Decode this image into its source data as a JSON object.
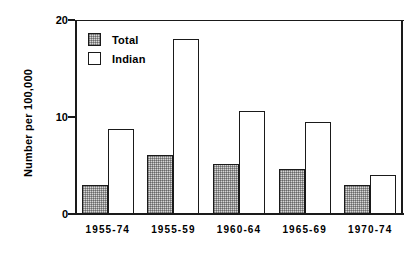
{
  "chart_data": {
    "type": "bar",
    "title": "",
    "xlabel": "",
    "ylabel": "Number per 100,000",
    "ylim": [
      0,
      20
    ],
    "yticks": [
      0,
      10,
      20
    ],
    "ytick_labels": [
      "0",
      "10",
      "20"
    ],
    "grid": false,
    "legend_position": "upper-left-inside",
    "categories": [
      "1955-74",
      "1955-59",
      "1960-64",
      "1965-69",
      "1970-74"
    ],
    "series": [
      {
        "name": "Total",
        "style": "stippled-gray",
        "color": "#d6d6d6",
        "values": [
          3.0,
          6.1,
          5.2,
          4.6,
          3.0
        ]
      },
      {
        "name": "Indian",
        "style": "open-white",
        "color": "#ffffff",
        "values": [
          8.8,
          18.0,
          10.6,
          9.5,
          4.0
        ]
      }
    ]
  },
  "legend": {
    "items": [
      {
        "label": "Total"
      },
      {
        "label": "Indian"
      }
    ]
  },
  "axes": {
    "line_color": "#1a1a1a"
  }
}
